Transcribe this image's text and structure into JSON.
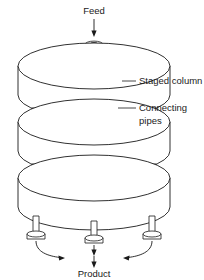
{
  "figure": {
    "kind": "process-flow-diagram",
    "background_color": "#ffffff",
    "line_color": "#1a1a1a"
  },
  "labels": {
    "feed": "Feed",
    "product": "Product",
    "staged_column": "Staged column",
    "connecting_pipes_line1": "Connecting",
    "connecting_pipes_line2": "pipes"
  },
  "components": {
    "stage_count": 3,
    "feed_inlet_count": 1,
    "connecting_pipe_rows": 2,
    "connecting_pipes_per_row": 3,
    "outlet_pipe_count": 3,
    "product_streams_merged_into": 1
  },
  "stages": [
    {
      "name": "stage-top",
      "order": 1
    },
    {
      "name": "stage-middle",
      "order": 2
    },
    {
      "name": "stage-bottom",
      "order": 3
    }
  ],
  "flows": [
    {
      "name": "feed-stream",
      "direction": "down",
      "label": "Feed"
    },
    {
      "name": "product-stream",
      "direction": "down",
      "label": "Product"
    }
  ]
}
